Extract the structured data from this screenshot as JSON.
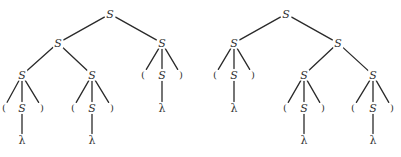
{
  "diagram": {
    "title": "",
    "type": "parse-trees",
    "colors": {
      "edge": "#2a2a2a",
      "text": "#333333",
      "background": "#ffffff"
    },
    "trees": [
      {
        "name": "tree-left",
        "nodes": [
          {
            "id": "L0",
            "label": "S",
            "x": 110,
            "y": 14
          },
          {
            "id": "L1",
            "label": "S",
            "x": 58,
            "y": 43
          },
          {
            "id": "L2",
            "label": "S",
            "x": 162,
            "y": 43
          },
          {
            "id": "L3",
            "label": "S",
            "x": 22,
            "y": 75
          },
          {
            "id": "L4",
            "label": "S",
            "x": 92,
            "y": 75
          },
          {
            "id": "L5",
            "label": "(",
            "x": 143,
            "y": 75
          },
          {
            "id": "L6",
            "label": "S",
            "x": 162,
            "y": 75
          },
          {
            "id": "L7",
            "label": ")",
            "x": 181,
            "y": 75
          },
          {
            "id": "L8",
            "label": "(",
            "x": 4,
            "y": 108
          },
          {
            "id": "L9",
            "label": "S",
            "x": 22,
            "y": 108
          },
          {
            "id": "L10",
            "label": ")",
            "x": 42,
            "y": 108
          },
          {
            "id": "L11",
            "label": "(",
            "x": 73,
            "y": 108
          },
          {
            "id": "L12",
            "label": "S",
            "x": 92,
            "y": 108
          },
          {
            "id": "L13",
            "label": ")",
            "x": 112,
            "y": 108
          },
          {
            "id": "L14",
            "label": "λ",
            "x": 162,
            "y": 108
          },
          {
            "id": "L15",
            "label": "λ",
            "x": 22,
            "y": 140
          },
          {
            "id": "L16",
            "label": "λ",
            "x": 92,
            "y": 140
          }
        ],
        "edges": [
          [
            "L0",
            "L1"
          ],
          [
            "L0",
            "L2"
          ],
          [
            "L1",
            "L3"
          ],
          [
            "L1",
            "L4"
          ],
          [
            "L2",
            "L5"
          ],
          [
            "L2",
            "L6"
          ],
          [
            "L2",
            "L7"
          ],
          [
            "L3",
            "L8"
          ],
          [
            "L3",
            "L9"
          ],
          [
            "L3",
            "L10"
          ],
          [
            "L4",
            "L11"
          ],
          [
            "L4",
            "L12"
          ],
          [
            "L4",
            "L13"
          ],
          [
            "L6",
            "L14"
          ],
          [
            "L9",
            "L15"
          ],
          [
            "L12",
            "L16"
          ]
        ]
      },
      {
        "name": "tree-right",
        "nodes": [
          {
            "id": "R0",
            "label": "S",
            "x": 286,
            "y": 14
          },
          {
            "id": "R1",
            "label": "S",
            "x": 234,
            "y": 43
          },
          {
            "id": "R2",
            "label": "S",
            "x": 338,
            "y": 43
          },
          {
            "id": "R3",
            "label": "(",
            "x": 215,
            "y": 75
          },
          {
            "id": "R4",
            "label": "S",
            "x": 234,
            "y": 75
          },
          {
            "id": "R5",
            "label": ")",
            "x": 253,
            "y": 75
          },
          {
            "id": "R6",
            "label": "S",
            "x": 304,
            "y": 75
          },
          {
            "id": "R7",
            "label": "S",
            "x": 373,
            "y": 75
          },
          {
            "id": "R8",
            "label": "λ",
            "x": 234,
            "y": 108
          },
          {
            "id": "R9",
            "label": "(",
            "x": 285,
            "y": 108
          },
          {
            "id": "R10",
            "label": "S",
            "x": 304,
            "y": 108
          },
          {
            "id": "R11",
            "label": ")",
            "x": 323,
            "y": 108
          },
          {
            "id": "R12",
            "label": "(",
            "x": 353,
            "y": 108
          },
          {
            "id": "R13",
            "label": "S",
            "x": 373,
            "y": 108
          },
          {
            "id": "R14",
            "label": ")",
            "x": 392,
            "y": 108
          },
          {
            "id": "R15",
            "label": "λ",
            "x": 304,
            "y": 140
          },
          {
            "id": "R16",
            "label": "λ",
            "x": 373,
            "y": 140
          }
        ],
        "edges": [
          [
            "R0",
            "R1"
          ],
          [
            "R0",
            "R2"
          ],
          [
            "R1",
            "R3"
          ],
          [
            "R1",
            "R4"
          ],
          [
            "R1",
            "R5"
          ],
          [
            "R2",
            "R6"
          ],
          [
            "R2",
            "R7"
          ],
          [
            "R4",
            "R8"
          ],
          [
            "R6",
            "R9"
          ],
          [
            "R6",
            "R10"
          ],
          [
            "R6",
            "R11"
          ],
          [
            "R7",
            "R12"
          ],
          [
            "R7",
            "R13"
          ],
          [
            "R7",
            "R14"
          ],
          [
            "R10",
            "R15"
          ],
          [
            "R13",
            "R16"
          ]
        ]
      }
    ]
  }
}
